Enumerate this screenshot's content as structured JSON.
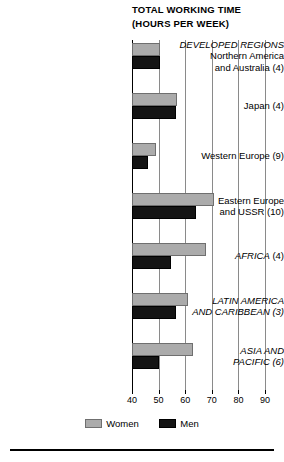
{
  "title": {
    "line1": "TOTAL WORKING TIME",
    "line2": "(HOURS PER WEEK)"
  },
  "legend": {
    "women_label": "Women",
    "men_label": "Men",
    "women_color": "#ababab",
    "men_color": "#141414"
  },
  "chart_data": {
    "type": "bar",
    "orientation": "horizontal",
    "title": "TOTAL WORKING TIME (HOURS PER WEEK)",
    "xlabel": "",
    "ylabel": "",
    "xlim": [
      40,
      90
    ],
    "xticks": [
      40,
      50,
      60,
      70,
      80,
      90
    ],
    "xticklabels": [
      "40",
      "50",
      "60",
      "70",
      "80",
      "90"
    ],
    "grid": true,
    "legend_position": "bottom",
    "baseline": 40,
    "categories": [
      "DEVELOPED REGIONS Northern America and Australia (4)",
      "Japan (4)",
      "Western Europe (9)",
      "Eastern Europe and USSR (10)",
      "AFRICA (4)",
      "LATIN AMERICA AND CARIBBEAN (3)",
      "ASIA AND PACIFIC (6)"
    ],
    "category_labels": [
      {
        "major": "DEVELOPED REGIONS",
        "sub": [
          "Northern America",
          "and Australia (4)"
        ]
      },
      {
        "major": "",
        "sub": [
          "Japan (4)"
        ]
      },
      {
        "major": "",
        "sub": [
          "Western Europe (9)"
        ]
      },
      {
        "major": "",
        "sub": [
          "Eastern Europe",
          "and USSR (10)"
        ]
      },
      {
        "major": "AFRICA",
        "sub": [
          " (4)"
        ]
      },
      {
        "major": "LATIN AMERICA",
        "sub": [
          "AND CARIBBEAN (3)"
        ]
      },
      {
        "major": "ASIA AND",
        "sub": [
          "PACIFIC (6)"
        ]
      }
    ],
    "series": [
      {
        "name": "Women",
        "color": "#ababab",
        "values": [
          50.5,
          57,
          49,
          71,
          68,
          61,
          63
        ]
      },
      {
        "name": "Men",
        "color": "#141414",
        "values": [
          50.5,
          56.5,
          46,
          64,
          54.5,
          56.5,
          50
        ]
      }
    ]
  }
}
